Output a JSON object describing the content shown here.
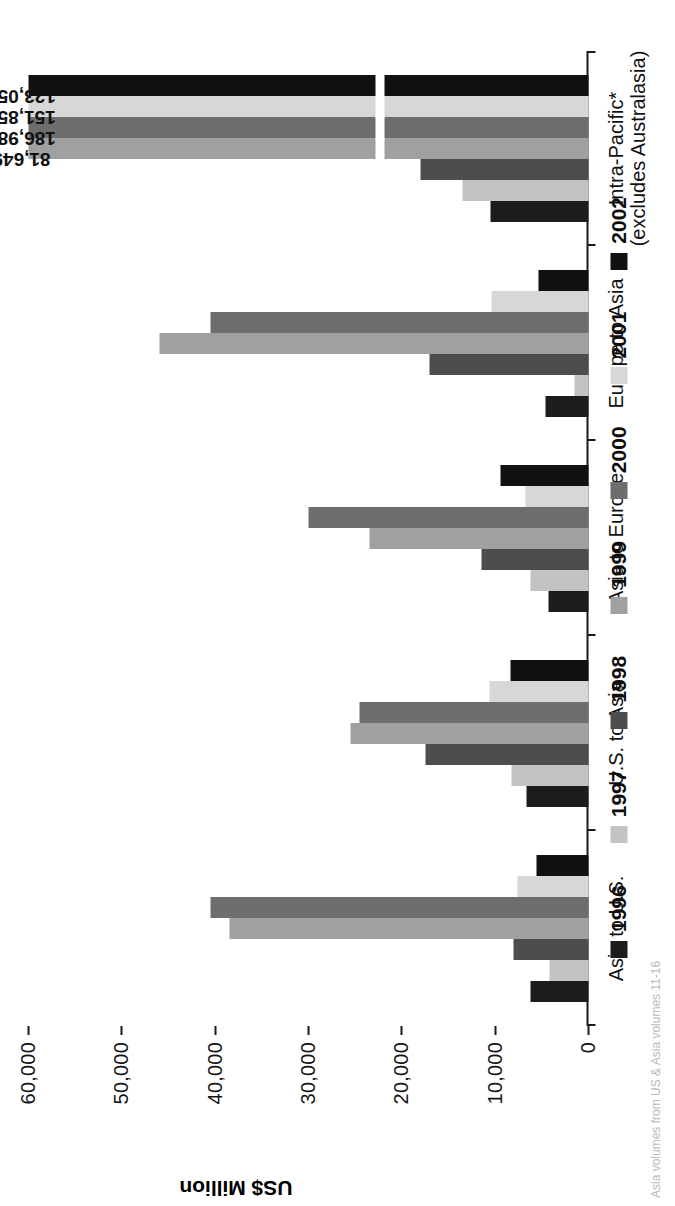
{
  "chart_data": {
    "type": "bar",
    "title": "",
    "xlabel": "",
    "ylabel": "US$ Million",
    "ylim": [
      0,
      60000
    ],
    "ytick_values": [
      0,
      10000,
      20000,
      30000,
      40000,
      50000,
      60000
    ],
    "ytick_labels": [
      "0",
      "10,000",
      "20,000",
      "30,000",
      "40,000",
      "50,000",
      "60,000"
    ],
    "grid": false,
    "legend_position": "bottom",
    "categories": [
      "Asia to U.S.",
      "U.S. to Asia",
      "Asia to Europe",
      "Europe to Asia",
      "Intra-Pacific*"
    ],
    "category_sublabels": [
      "",
      "",
      "",
      "",
      "(excludes Australasia)"
    ],
    "series": [
      {
        "name": "1996",
        "color": "#1c1c1c",
        "values": [
          6200,
          6600,
          4300,
          4600,
          10500
        ]
      },
      {
        "name": "1997",
        "color": "#c3c3c3",
        "values": [
          4200,
          8200,
          6200,
          1500,
          13500
        ]
      },
      {
        "name": "1998",
        "color": "#4d4d4d",
        "values": [
          8000,
          17500,
          11500,
          17000,
          18000
        ]
      },
      {
        "name": "1999",
        "color": "#a0a0a0",
        "values": [
          38500,
          25500,
          23500,
          46000,
          81649
        ]
      },
      {
        "name": "2000",
        "color": "#6e6e6e",
        "values": [
          40500,
          24500,
          30000,
          40500,
          186984
        ]
      },
      {
        "name": "2001",
        "color": "#d7d7d7",
        "values": [
          7600,
          10600,
          6700,
          10400,
          151854
        ]
      },
      {
        "name": "2002",
        "color": "#111111",
        "values": [
          5600,
          8400,
          9400,
          5400,
          123054
        ]
      }
    ],
    "data_labels": {
      "Intra-Pacific*": {
        "1999": "81,649",
        "2000": "186,984",
        "2001": "151,854",
        "2002": "123,054"
      }
    },
    "axis_break_note": "Bars for 1999-2002 in Intra-Pacific* are truncated with an axis break"
  },
  "footnote": {
    "text": "Asia volumes from US & Asia volumes 11-16"
  }
}
